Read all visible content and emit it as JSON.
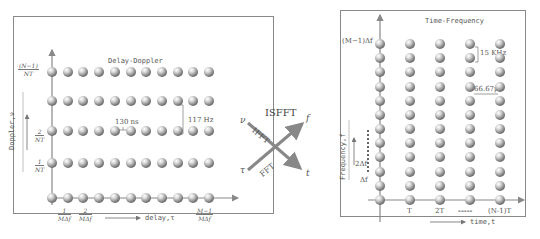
{
  "delay_doppler": {
    "title": "Delay-Doppler",
    "y_axis_label": "Doppler,ν",
    "x_axis_label": "delay,τ",
    "rows": 5,
    "cols": 11,
    "y_ticks": [
      {
        "num": "(N−1)",
        "den": "NT"
      },
      {
        "num": "2",
        "den": "NT"
      },
      {
        "num": "1",
        "den": "NT"
      }
    ],
    "x_ticks": [
      {
        "num": "1",
        "den": "MΔf"
      },
      {
        "num": "2",
        "den": "MΔf"
      },
      {
        "num": "M−1",
        "den": "MΔf"
      }
    ],
    "delay_resolution": "130 ns",
    "doppler_resolution": "117 Hz"
  },
  "transform": {
    "top_label": "ISFFT",
    "ifft_label": "IFFT",
    "fft_label": "FFT",
    "nu": "ν",
    "tau": "τ",
    "f": "f",
    "t": "t"
  },
  "time_frequency": {
    "title": "Time-Frequency",
    "y_axis_label": "Frequency,f",
    "x_axis_label": "time,t",
    "rows": 12,
    "cols": 5,
    "y_ticks": [
      "(M−1)Δf",
      "2Δf",
      "Δf"
    ],
    "x_ticks": [
      "T",
      "2T",
      "-----",
      "(N-1)T"
    ],
    "subcarrier_spacing": "15 KHz",
    "symbol_duration": "66.67μs"
  }
}
